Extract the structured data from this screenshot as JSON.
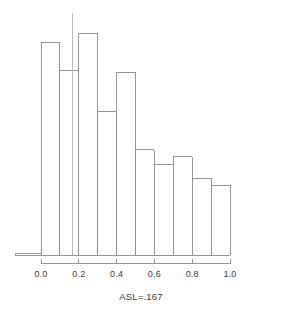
{
  "chart_data": {
    "type": "bar",
    "title": "",
    "subtitle": "",
    "xlabel": "ASL=.167",
    "ylabel": "",
    "xlim": [
      -0.135,
      1.0
    ],
    "ylim": [
      0,
      1.0
    ],
    "grid": false,
    "legend": null,
    "xticks": [
      "0.0",
      "0.2",
      "0.4",
      "0.6",
      "0.8",
      "1.0"
    ],
    "xtick_values": [
      0.0,
      0.2,
      0.4,
      0.6,
      0.8,
      1.0
    ],
    "yticks": [],
    "bin_edges": [
      -0.135,
      0.0,
      0.1,
      0.2,
      0.3,
      0.4,
      0.5,
      0.6,
      0.7,
      0.8,
      0.9,
      1.0
    ],
    "categories": [
      "-0.135-0.0",
      "0.0-0.1",
      "0.1-0.2",
      "0.2-0.3",
      "0.3-0.4",
      "0.4-0.5",
      "0.5-0.6",
      "0.6-0.7",
      "0.7-0.8",
      "0.8-0.9",
      "0.9-1.0"
    ],
    "values": [
      0.006,
      0.879,
      0.764,
      0.917,
      0.591,
      0.756,
      0.434,
      0.372,
      0.405,
      0.318,
      0.289
    ],
    "annotations": [
      {
        "name": "observed-statistic-line",
        "type": "vline",
        "x": 0.167,
        "y_top": 1.0
      }
    ],
    "colors": {
      "bar_edge": "#8c8c8c",
      "bar_fill": "#ffffff",
      "axis": "#8c8c8c",
      "reference_line": "#b4b4b4",
      "text": "#3a3a3a"
    }
  },
  "axis": {
    "tick_labels": [
      "0.0",
      "0.2",
      "0.4",
      "0.6",
      "0.8",
      "1.0"
    ],
    "caption": "ASL=.167"
  }
}
